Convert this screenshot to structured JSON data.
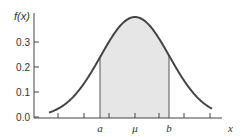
{
  "chart_data": {
    "type": "area",
    "title": "",
    "ylabel": "f(x)",
    "xlabel": "x",
    "y_ticks": [
      "0.0",
      "0.1",
      "0.2",
      "0.3"
    ],
    "ylim": [
      0.0,
      0.4
    ],
    "x_tick_labels": [
      {
        "label": "a",
        "position": "left of mean"
      },
      {
        "label": "μ",
        "position": "mean"
      },
      {
        "label": "b",
        "position": "right of mean"
      }
    ],
    "distribution": {
      "name": "normal",
      "peak_density": 0.4
    },
    "shaded_region": {
      "from": "a",
      "to": "b"
    },
    "grid": false,
    "legend": null,
    "colors": {
      "curve": "#444444",
      "fill": "#e6e6e6",
      "axis": "#444444"
    }
  }
}
